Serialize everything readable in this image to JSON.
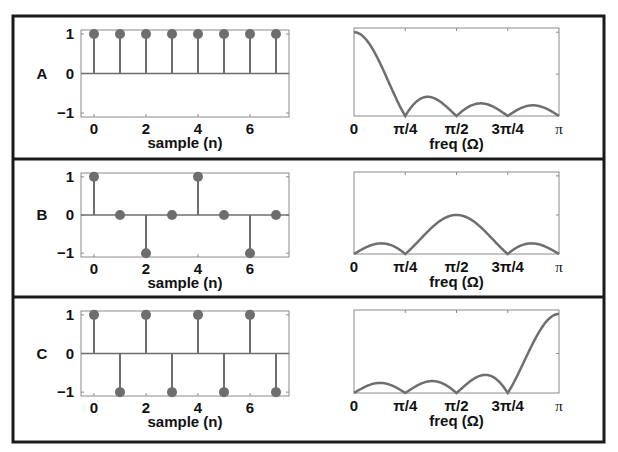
{
  "colors": {
    "stem": "#6e6e6e",
    "curve": "#6e6e6e",
    "axis": "#8a8a8a",
    "frame": "#1a1a1a",
    "text": "#111111"
  },
  "chart_data": [
    {
      "row": "A",
      "type": "stem",
      "xlabel": "sample (n)",
      "x": [
        0,
        1,
        2,
        3,
        4,
        5,
        6,
        7
      ],
      "values": [
        1,
        1,
        1,
        1,
        1,
        1,
        1,
        1
      ],
      "xticks": [
        "0",
        "2",
        "4",
        "6"
      ],
      "yticks": [
        "1",
        "0",
        "−1"
      ],
      "ylim": [
        -1,
        1
      ],
      "xlim": [
        -0.5,
        7.5
      ]
    },
    {
      "row": "A",
      "type": "line",
      "xlabel": "freq (Ω)",
      "xticks": [
        "0",
        "π/4",
        "π/2",
        "3π/4",
        "π"
      ],
      "xlim": [
        0,
        3.14159
      ],
      "ylim": [
        0,
        1.05
      ],
      "signal": [
        1,
        1,
        1,
        1,
        1,
        1,
        1,
        1
      ],
      "description": "|DTFT| normalized, peak at 0, zeros at π/4, π/2, 3π/4"
    },
    {
      "row": "B",
      "type": "stem",
      "xlabel": "sample (n)",
      "x": [
        0,
        1,
        2,
        3,
        4,
        5,
        6,
        7
      ],
      "values": [
        1,
        0,
        -1,
        0,
        1,
        0,
        -1,
        0
      ],
      "xticks": [
        "0",
        "2",
        "4",
        "6"
      ],
      "yticks": [
        "1",
        "0",
        "−1"
      ],
      "ylim": [
        -1,
        1
      ],
      "xlim": [
        -0.5,
        7.5
      ]
    },
    {
      "row": "B",
      "type": "line",
      "xlabel": "freq (Ω)",
      "xticks": [
        "0",
        "π/4",
        "π/2",
        "3π/4",
        "π"
      ],
      "xlim": [
        0,
        3.14159
      ],
      "ylim": [
        0,
        1.05
      ],
      "signal": [
        1,
        0,
        -1,
        0,
        1,
        0,
        -1,
        0
      ],
      "description": "|DTFT| normalized, peak at π/2"
    },
    {
      "row": "C",
      "type": "stem",
      "xlabel": "sample (n)",
      "x": [
        0,
        1,
        2,
        3,
        4,
        5,
        6,
        7
      ],
      "values": [
        1,
        -1,
        1,
        -1,
        1,
        -1,
        1,
        -1
      ],
      "xticks": [
        "0",
        "2",
        "4",
        "6"
      ],
      "yticks": [
        "1",
        "0",
        "−1"
      ],
      "ylim": [
        -1,
        1
      ],
      "xlim": [
        -0.5,
        7.5
      ]
    },
    {
      "row": "C",
      "type": "line",
      "xlabel": "freq (Ω)",
      "xticks": [
        "0",
        "π/4",
        "π/2",
        "3π/4",
        "π"
      ],
      "xlim": [
        0,
        3.14159
      ],
      "ylim": [
        0,
        1.05
      ],
      "signal": [
        1,
        -1,
        1,
        -1,
        1,
        -1,
        1,
        -1
      ],
      "description": "|DTFT| normalized, peak at π"
    }
  ]
}
